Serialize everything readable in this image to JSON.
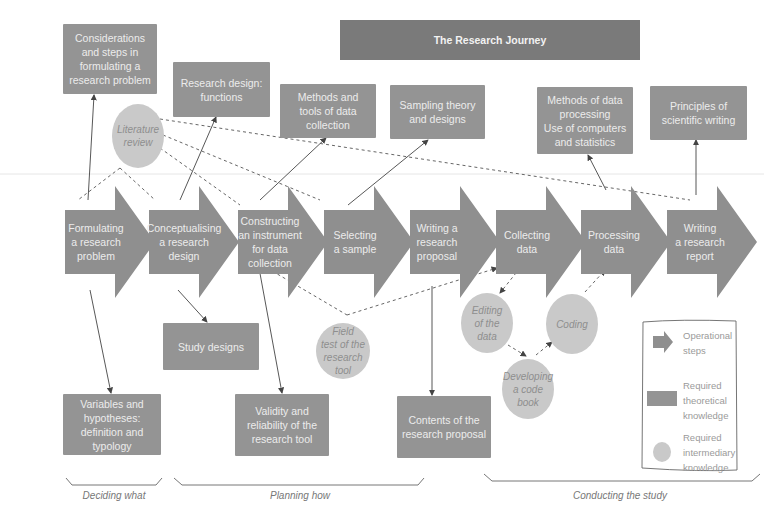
{
  "title": "The Research Journey",
  "colors": {
    "step_fill": "#8f8f8f",
    "theory_box": "#949494",
    "title_bar": "#7a7a7a",
    "intermediary_blob": "#c9c9c9",
    "text_light": "#ececec",
    "text_italic": "#8e8e8e",
    "connector": "#444444"
  },
  "steps": [
    {
      "label": "Formulating\na research\nproblem"
    },
    {
      "label": "Conceptualising\na research\ndesign"
    },
    {
      "label": "Constructing\nan instrument\nfor data\ncollection"
    },
    {
      "label": "Selecting\na sample"
    },
    {
      "label": "Writing a\nresearch\nproposal"
    },
    {
      "label": "Collecting\ndata"
    },
    {
      "label": "Processing\ndata"
    },
    {
      "label": "Writing\na research\nreport"
    }
  ],
  "theory_boxes_top": [
    {
      "label": "Considerations\nand steps in\nformulating a\nresearch problem"
    },
    {
      "label": "Research design:\nfunctions"
    },
    {
      "label": "Methods and\ntools of data\ncollection"
    },
    {
      "label": "Sampling theory\nand designs"
    },
    {
      "label": "Methods of data\nprocessing\nUse of computers\nand statistics"
    },
    {
      "label": "Principles of\nscientific writing"
    }
  ],
  "theory_boxes_bottom": [
    {
      "label": "Study designs"
    },
    {
      "label": "Variables and\nhypotheses:\ndefinition and typology"
    },
    {
      "label": "Validity and\nreliability of the\nresearch tool"
    },
    {
      "label": "Contents of the\nresearch proposal"
    }
  ],
  "intermediary": [
    {
      "label": "Literature\nreview"
    },
    {
      "label": "Field\ntest of the\nresearch\ntool"
    },
    {
      "label": "Editing\nof the\ndata"
    },
    {
      "label": "Coding"
    },
    {
      "label": "Developing\na code\nbook"
    }
  ],
  "phases": [
    {
      "label": "Deciding what"
    },
    {
      "label": "Planning how"
    },
    {
      "label": "Conducting the study"
    }
  ],
  "legend": {
    "items": [
      {
        "icon": "arrow-shape",
        "label": "Operational\nsteps"
      },
      {
        "icon": "rectangle-shape",
        "label": "Required\ntheoretical\nknowledge"
      },
      {
        "icon": "circle-shape",
        "label": "Required\nintermediary\nknowledge"
      }
    ]
  }
}
